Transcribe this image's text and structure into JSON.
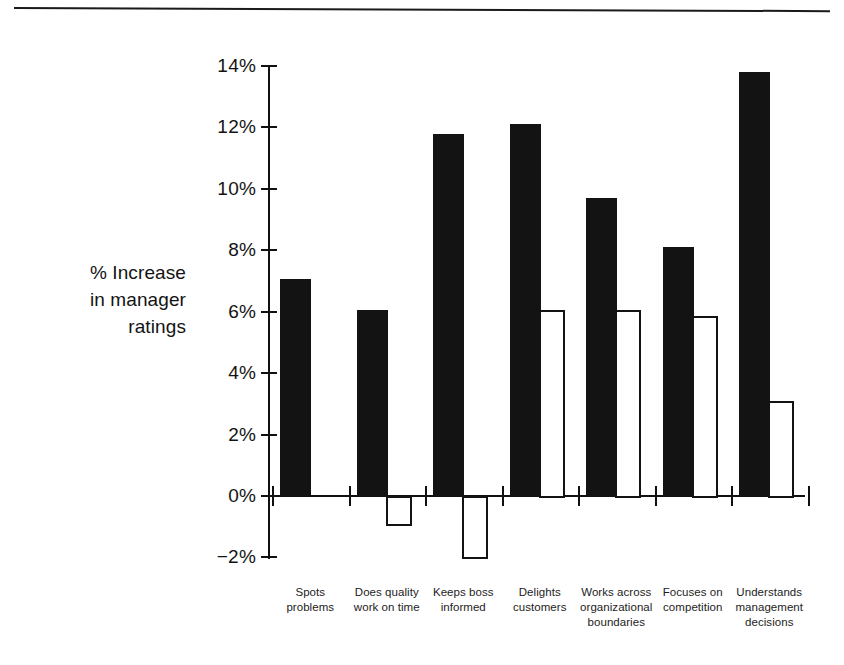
{
  "chart_data": {
    "type": "bar",
    "title": "",
    "subtitle": "",
    "xlabel": "",
    "ylabel": "% Increase in manager ratings",
    "ylabel_lines": [
      "% Increase",
      "in manager",
      "ratings"
    ],
    "ylim": [
      -2,
      14
    ],
    "ytick_values": [
      14,
      12,
      10,
      8,
      6,
      4,
      2,
      0,
      -2
    ],
    "ytick_labels": [
      "14%",
      "12%",
      "10%",
      "8%",
      "6%",
      "4%",
      "2%",
      "0%",
      "−2%"
    ],
    "grid": false,
    "legend": null,
    "legend_position": "none",
    "categories": [
      "Spots problems",
      "Does quality work on time",
      "Keeps boss informed",
      "Delights customers",
      "Works across organizational boundaries",
      "Focuses on competition",
      "Understands management decisions"
    ],
    "category_label_lines": [
      [
        "Spots",
        "problems"
      ],
      [
        "Does quality",
        "work on time"
      ],
      [
        "Keeps boss",
        "informed"
      ],
      [
        "Delights",
        "customers"
      ],
      [
        "Works across",
        "organizational",
        "boundaries"
      ],
      [
        "Focuses on",
        "competition"
      ],
      [
        "Understands",
        "management",
        "decisions"
      ]
    ],
    "series": [
      {
        "name": "filled",
        "style": "solid-black",
        "color": "#131313",
        "values": [
          7.05,
          6.05,
          11.8,
          12.1,
          9.7,
          8.1,
          13.8
        ]
      },
      {
        "name": "outlined",
        "style": "white-outlined",
        "color": "#ffffff",
        "edge_color": "#131313",
        "values": [
          null,
          -0.9,
          -2.0,
          6.05,
          6.05,
          5.85,
          3.1
        ]
      }
    ]
  },
  "colors": {
    "background": "#ffffff",
    "ink": "#131313",
    "bar_filled": "#131313",
    "bar_outlined_fill": "#ffffff",
    "bar_outlined_edge": "#131313"
  }
}
